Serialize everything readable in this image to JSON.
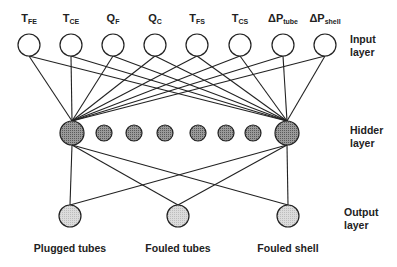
{
  "input_layer": {
    "label_line1": "Input",
    "label_line2": "layer",
    "nodes": [
      {
        "main": "T",
        "sub": "FE"
      },
      {
        "main": "T",
        "sub": "CE"
      },
      {
        "main": "Q",
        "sub": "F"
      },
      {
        "main": "Q",
        "sub": "C"
      },
      {
        "main": "T",
        "sub": "FS"
      },
      {
        "main": "T",
        "sub": "CS"
      },
      {
        "main": "ΔP",
        "sub": "tube"
      },
      {
        "main": "ΔP",
        "sub": "shell"
      }
    ]
  },
  "hidden_layer": {
    "label_line1": "Hidder",
    "label_line2": "layer",
    "node_count": 8
  },
  "output_layer": {
    "label_line1": "Output",
    "label_line2": "layer",
    "nodes": [
      "Plugged tubes",
      "Fouled tubes",
      "Fouled shell"
    ]
  },
  "colors": {
    "stroke": "#222222",
    "hidden_fill": "#8a8a8a",
    "output_fill": "#d4d4d4"
  }
}
